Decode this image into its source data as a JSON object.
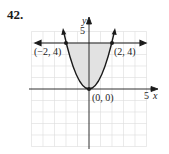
{
  "problem": {
    "number": "42."
  },
  "axes": {
    "x_label": "x",
    "y_label": "y",
    "x_tick_label": "5",
    "y_tick_label": "5",
    "xlim": [
      -5,
      5
    ],
    "ylim": [
      -5,
      5
    ],
    "grid": true,
    "grid_step": 1
  },
  "curves": [
    {
      "name": "parabola",
      "equation": "y = x^2"
    },
    {
      "name": "horizontal-line",
      "equation": "y = 4"
    }
  ],
  "shaded_region": {
    "description": "region between y = x^2 and y = 4",
    "fill": "#e0e0e0"
  },
  "points": [
    {
      "label": "(−2, 4)",
      "x": -2,
      "y": 4
    },
    {
      "label": "(2, 4)",
      "x": 2,
      "y": 4
    },
    {
      "label": "(0, 0)",
      "x": 0,
      "y": 0
    }
  ],
  "colors": {
    "curve": "#1a1a1a",
    "grid": "#d8d8d8",
    "shade": "#e0e0e0"
  }
}
